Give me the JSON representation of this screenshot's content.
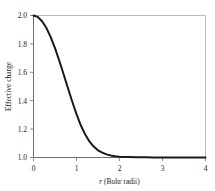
{
  "chart_data": {
    "type": "line",
    "title": "",
    "xlabel": "r (Bohr radii)",
    "xlabel_symbol": "r",
    "xlabel_rest": " (Bohr radii)",
    "ylabel": "Effective charge",
    "xlim": [
      0,
      4
    ],
    "ylim": [
      1.0,
      2.0
    ],
    "xticks": [
      0,
      1,
      2,
      3,
      4
    ],
    "xtick_labels": [
      "0",
      "1",
      "2",
      "3",
      "4"
    ],
    "yticks": [
      1.0,
      1.2,
      1.4,
      1.6,
      1.8,
      2.0
    ],
    "ytick_labels": [
      "1.0",
      "1.2",
      "1.4",
      "1.6",
      "1.8",
      "2.0"
    ],
    "grid": false,
    "legend": false,
    "series": [
      {
        "name": "Effective charge",
        "color": "#1a1a1a",
        "x": [
          0.0,
          0.1,
          0.2,
          0.3,
          0.4,
          0.5,
          0.6,
          0.7,
          0.8,
          0.9,
          1.0,
          1.1,
          1.2,
          1.3,
          1.4,
          1.5,
          1.6,
          1.7,
          1.8,
          1.9,
          2.0,
          2.2,
          2.4,
          2.6,
          2.8,
          3.0,
          3.2,
          3.4,
          3.6,
          3.8,
          4.0
        ],
        "y": [
          2.0,
          1.99,
          1.96,
          1.912,
          1.848,
          1.77,
          1.681,
          1.586,
          1.489,
          1.394,
          1.305,
          1.227,
          1.163,
          1.113,
          1.077,
          1.051,
          1.034,
          1.022,
          1.014,
          1.009,
          1.006,
          1.003,
          1.001,
          1.001,
          1.0,
          1.0,
          1.0,
          1.0,
          1.0,
          1.0,
          1.0
        ]
      }
    ]
  },
  "axis_ticks": {
    "x": [
      "0",
      "1",
      "2",
      "3",
      "4"
    ],
    "y": [
      "2.0",
      "1.8",
      "1.6",
      "1.4",
      "1.2",
      "1.0"
    ]
  },
  "labels": {
    "x_axis_title_symbol": "r",
    "x_axis_title_rest": " (Bohr radii)",
    "y_axis_title": "Effective charge"
  }
}
